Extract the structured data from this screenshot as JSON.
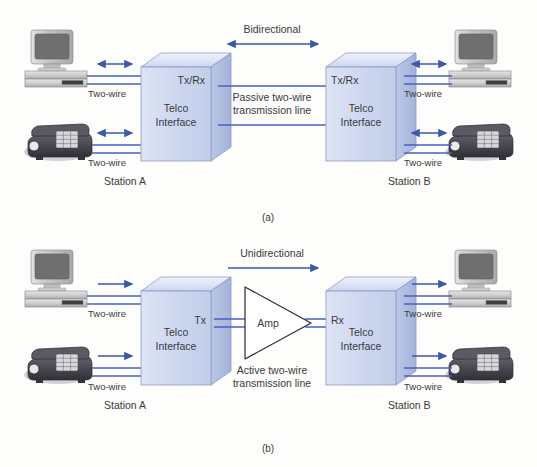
{
  "figure": {
    "panels": [
      {
        "id": "a",
        "caption": "(a)",
        "direction_label": "Bidirectional",
        "link_label_line1": "Passive two-wire",
        "link_label_line2": "transmission line",
        "left_station": {
          "name": "Station A",
          "box_line1": "Telco",
          "box_line2": "Interface",
          "port_label": "Tx/Rx",
          "computer_wire_label": "Two-wire",
          "phone_wire_label": "Two-wire",
          "computer_arrow": "bidirectional",
          "phone_arrow": "bidirectional"
        },
        "right_station": {
          "name": "Station B",
          "box_line1": "Telco",
          "box_line2": "Interface",
          "port_label": "Tx/Rx",
          "computer_wire_label": "Two-wire",
          "phone_wire_label": "Two-wire",
          "computer_arrow": "bidirectional",
          "phone_arrow": "bidirectional"
        }
      },
      {
        "id": "b",
        "caption": "(b)",
        "direction_label": "Unidirectional",
        "link_label_line1": "Active two-wire",
        "link_label_line2": "transmission line",
        "amplifier_label": "Amp",
        "left_station": {
          "name": "Station A",
          "box_line1": "Telco",
          "box_line2": "Interface",
          "port_label": "Tx",
          "computer_wire_label": "Two-wire",
          "phone_wire_label": "Two-wire",
          "computer_arrow": "unidirectional",
          "phone_arrow": "unidirectional"
        },
        "right_station": {
          "name": "Station B",
          "box_line1": "Telco",
          "box_line2": "Interface",
          "port_label": "Rx",
          "computer_wire_label": "Two-wire",
          "phone_wire_label": "Two-wire",
          "computer_arrow": "unidirectional",
          "phone_arrow": "unidirectional"
        }
      }
    ]
  },
  "colors": {
    "background": "#fdfdfb",
    "wire_blue": "#4a5fc1",
    "arrow_blue": "#3d56b2",
    "box_front": "#ccd6ef",
    "box_top": "#e3e9f7",
    "box_side": "#aebbe0",
    "box_stroke": "#8d9bc4",
    "text": "#3a3a3c",
    "monitor_body": "#c9c9c9",
    "monitor_screen": "#6f6f6f",
    "phone_body": "#4a4a52",
    "triangle_stroke": "#2b2b2b"
  },
  "icons": {
    "computer": "desktop-computer-icon",
    "phone": "desk-telephone-icon",
    "amplifier": "amplifier-triangle-icon",
    "arrow_bi": "double-arrow-icon",
    "arrow_uni": "single-arrow-icon"
  }
}
